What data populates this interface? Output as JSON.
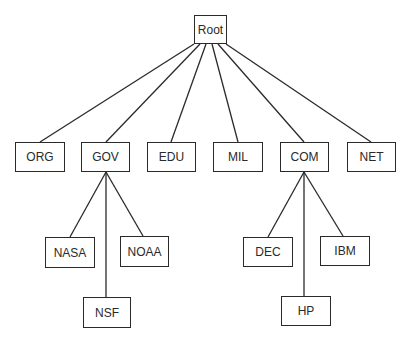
{
  "diagram": {
    "type": "tree",
    "title": "",
    "nodes": [
      {
        "id": "root",
        "label": "Root",
        "x": 194,
        "y": 15,
        "w": 33,
        "h": 29
      },
      {
        "id": "org",
        "label": "ORG",
        "x": 15,
        "y": 142,
        "w": 50,
        "h": 30
      },
      {
        "id": "gov",
        "label": "GOV",
        "x": 81,
        "y": 142,
        "w": 49,
        "h": 30
      },
      {
        "id": "edu",
        "label": "EDU",
        "x": 147,
        "y": 142,
        "w": 49,
        "h": 30
      },
      {
        "id": "mil",
        "label": "MIL",
        "x": 213,
        "y": 142,
        "w": 50,
        "h": 30
      },
      {
        "id": "com",
        "label": "COM",
        "x": 280,
        "y": 142,
        "w": 49,
        "h": 30
      },
      {
        "id": "net",
        "label": "NET",
        "x": 347,
        "y": 142,
        "w": 49,
        "h": 30
      },
      {
        "id": "nasa",
        "label": "NASA",
        "x": 45,
        "y": 237,
        "w": 50,
        "h": 31
      },
      {
        "id": "noaa",
        "label": "NOAA",
        "x": 120,
        "y": 236,
        "w": 49,
        "h": 31
      },
      {
        "id": "nsf",
        "label": "NSF",
        "x": 83,
        "y": 297,
        "w": 48,
        "h": 31
      },
      {
        "id": "dec",
        "label": "DEC",
        "x": 243,
        "y": 237,
        "w": 50,
        "h": 30
      },
      {
        "id": "ibm",
        "label": "IBM",
        "x": 320,
        "y": 236,
        "w": 50,
        "h": 30
      },
      {
        "id": "hp",
        "label": "HP",
        "x": 281,
        "y": 296,
        "w": 50,
        "h": 30
      }
    ],
    "edges": [
      {
        "from": "root",
        "to": "org",
        "x1": 194,
        "y1": 44,
        "x2": 40,
        "y2": 142
      },
      {
        "from": "root",
        "to": "gov",
        "x1": 200,
        "y1": 44,
        "x2": 106,
        "y2": 142
      },
      {
        "from": "root",
        "to": "edu",
        "x1": 206,
        "y1": 44,
        "x2": 171,
        "y2": 142
      },
      {
        "from": "root",
        "to": "mil",
        "x1": 212,
        "y1": 44,
        "x2": 238,
        "y2": 142
      },
      {
        "from": "root",
        "to": "com",
        "x1": 218,
        "y1": 44,
        "x2": 304,
        "y2": 142
      },
      {
        "from": "root",
        "to": "net",
        "x1": 226,
        "y1": 44,
        "x2": 371,
        "y2": 142
      },
      {
        "from": "gov",
        "to": "nasa",
        "x1": 106,
        "y1": 172,
        "x2": 70,
        "y2": 237
      },
      {
        "from": "gov",
        "to": "nsf",
        "x1": 106,
        "y1": 172,
        "x2": 106,
        "y2": 297
      },
      {
        "from": "gov",
        "to": "noaa",
        "x1": 106,
        "y1": 172,
        "x2": 143,
        "y2": 236
      },
      {
        "from": "com",
        "to": "dec",
        "x1": 304,
        "y1": 172,
        "x2": 268,
        "y2": 237
      },
      {
        "from": "com",
        "to": "hp",
        "x1": 304,
        "y1": 172,
        "x2": 304,
        "y2": 296
      },
      {
        "from": "com",
        "to": "ibm",
        "x1": 304,
        "y1": 172,
        "x2": 343,
        "y2": 236
      }
    ]
  }
}
